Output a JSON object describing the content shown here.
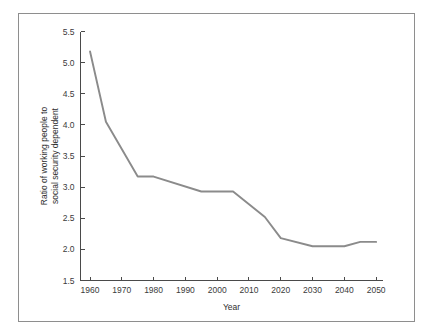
{
  "figure": {
    "background_color": "#ffffff",
    "frame_color": "#8e8e8e",
    "axis_color": "#4a4a4a"
  },
  "chart_data": {
    "type": "line",
    "title": "",
    "subtitle": "",
    "xlabel": "Year",
    "ylabel": "Ratio of working people to social security dependent",
    "ylabel_line1": "Ratio of working people to",
    "ylabel_line2": "social security dependent",
    "xlim": [
      1957,
      2052
    ],
    "ylim": [
      1.5,
      5.5
    ],
    "xticks": [
      1960,
      1970,
      1980,
      1990,
      2000,
      2010,
      2020,
      2030,
      2040,
      2050
    ],
    "xtick_labels": [
      "1960",
      "1970",
      "1980",
      "1990",
      "2000",
      "2010",
      "2020",
      "2030",
      "2040",
      "2050"
    ],
    "yticks": [
      1.5,
      2.0,
      2.5,
      3.0,
      3.5,
      4.0,
      4.5,
      5.0,
      5.5
    ],
    "ytick_labels": [
      "1.5",
      "2.0",
      "2.5",
      "3.0",
      "3.5",
      "4.0",
      "4.5",
      "5.0",
      "5.5"
    ],
    "grid": false,
    "legend": false,
    "legend_position": "none",
    "series": [
      {
        "name": "Ratio of working people to social security dependent",
        "color": "#8b8b8b",
        "x": [
          1960,
          1965,
          1975,
          1980,
          1995,
          2005,
          2015,
          2020,
          2030,
          2040,
          2045,
          2050
        ],
        "values": [
          5.18,
          4.05,
          3.17,
          3.17,
          2.93,
          2.93,
          2.52,
          2.18,
          2.05,
          2.05,
          2.12,
          2.12
        ]
      }
    ]
  }
}
